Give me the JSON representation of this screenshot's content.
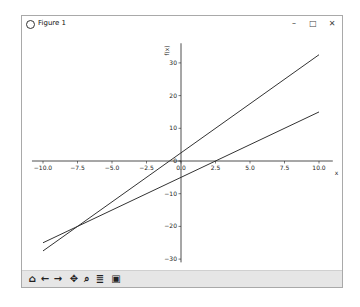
{
  "window": {
    "title": "Figure 1",
    "controls": {
      "minimize": "–",
      "maximize": "□",
      "close": "✕"
    }
  },
  "toolbar": {
    "buttons": [
      {
        "name": "home-icon",
        "glyph": "⌂"
      },
      {
        "name": "back-icon",
        "glyph": "←"
      },
      {
        "name": "forward-icon",
        "glyph": "→"
      },
      {
        "name": "pan-icon",
        "glyph": "✥"
      },
      {
        "name": "zoom-icon",
        "glyph": "⌕"
      },
      {
        "name": "configure-subplots-icon",
        "glyph": "≣"
      },
      {
        "name": "save-icon",
        "glyph": "▣"
      }
    ]
  },
  "chart_data": {
    "type": "line",
    "title": "",
    "xlabel": "x",
    "ylabel": "f(x)",
    "xlim": [
      -10.8,
      11
    ],
    "ylim": [
      -31,
      36
    ],
    "x_ticks": [
      "-10.0",
      "-7.5",
      "-5.0",
      "-2.5",
      "0.0",
      "2.5",
      "5.0",
      "7.5",
      "10.0"
    ],
    "y_ticks": [
      "-30",
      "-20",
      "-10",
      "0",
      "10",
      "20",
      "30"
    ],
    "grid": false,
    "legend": null,
    "spines": "centered at origin",
    "series": [
      {
        "name": "line 1",
        "x": [
          -10,
          10
        ],
        "y": [
          -27.5,
          32.5
        ],
        "color": "#333333"
      },
      {
        "name": "line 2",
        "x": [
          -10,
          10
        ],
        "y": [
          -25,
          15
        ],
        "color": "#333333"
      }
    ]
  }
}
